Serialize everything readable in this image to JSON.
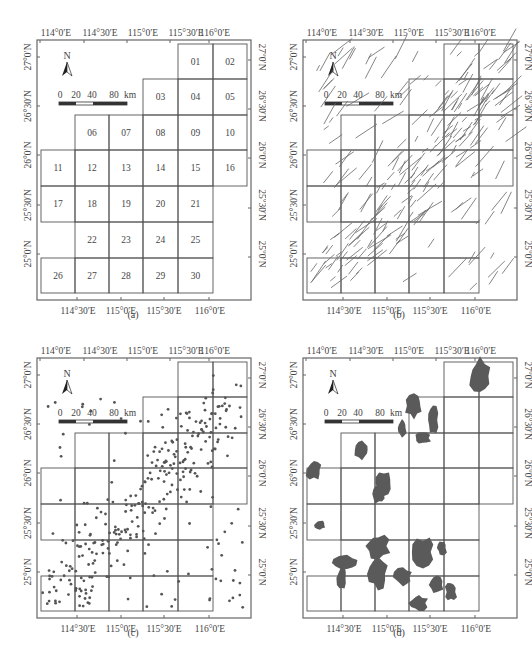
{
  "figure": {
    "panels": [
      {
        "id": "a",
        "caption": "(a)"
      },
      {
        "id": "b",
        "caption": "(b)"
      },
      {
        "id": "c",
        "caption": "(c)"
      },
      {
        "id": "d",
        "caption": "(d)"
      }
    ],
    "top_axis_labels": [
      "114°0′E",
      "114°30′E",
      "115°0′E",
      "115°30′E",
      "116°0′E"
    ],
    "bottom_axis_labels": [
      "114°30′E",
      "115°0′E",
      "115°30′E",
      "116°0′E"
    ],
    "lat_labels": [
      "27°0′N",
      "26°30′N",
      "26°0′N",
      "25°30′N",
      "25°0′N"
    ],
    "north_arrow": "N",
    "scale_bar": {
      "ticks": [
        "0",
        "20",
        "40",
        "80"
      ],
      "unit": "km"
    },
    "grid_cells": [
      "01",
      "02",
      "03",
      "04",
      "05",
      "06",
      "07",
      "08",
      "09",
      "10",
      "11",
      "12",
      "13",
      "14",
      "15",
      "16",
      "17",
      "18",
      "19",
      "20",
      "21",
      "22",
      "23",
      "24",
      "25",
      "26",
      "27",
      "28",
      "29",
      "30"
    ],
    "colors": {
      "frame": "#555555",
      "grid": "#444444",
      "faults": "#555555",
      "points": "#555555",
      "polygons": "#5a5a5a"
    }
  }
}
